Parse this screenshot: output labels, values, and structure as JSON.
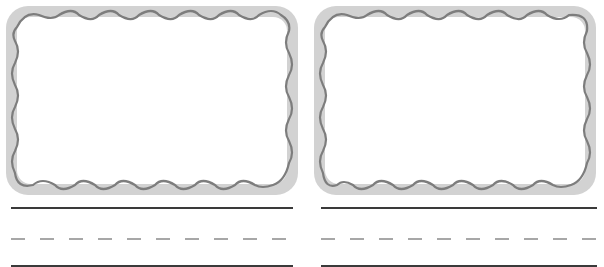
{
  "worksheet": {
    "cards": [
      {
        "id": "left",
        "x": 5,
        "frame_width": 294,
        "frame_height": 191,
        "line_x": 11,
        "line_width": 282
      },
      {
        "id": "right",
        "x": 313,
        "frame_width": 284,
        "frame_height": 191,
        "line_x": 321,
        "line_width": 276
      }
    ],
    "writing_lines": {
      "top_y": 207,
      "mid_y": 237,
      "bottom_y": 265
    },
    "colors": {
      "band": "#d2d2d2",
      "wave": "#7d7d7d",
      "line_solid": "#3a3a3a",
      "line_dashed": "#8a8a8a",
      "inside": "#ffffff"
    },
    "icons": [
      "wavy-frame-icon"
    ]
  }
}
